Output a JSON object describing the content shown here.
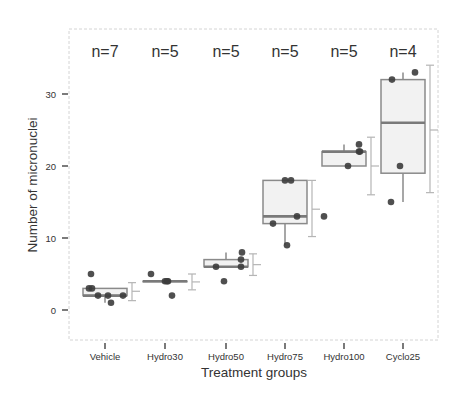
{
  "chart_data": {
    "type": "box",
    "title": "",
    "xlabel": "Treatment groups",
    "ylabel": "Number of micronuclei",
    "ylim": [
      -4,
      38
    ],
    "yticks": [
      0,
      10,
      20,
      30
    ],
    "grid": false,
    "legend": null,
    "categories": [
      "Vehicle",
      "Hydro30",
      "Hydro50",
      "Hydro75",
      "Hydro100",
      "Cyclo25"
    ],
    "n_labels": [
      "n=7",
      "n=5",
      "n=5",
      "n=5",
      "n=5",
      "n=4"
    ],
    "boxes": [
      {
        "category": "Vehicle",
        "min": 1,
        "q1": 2,
        "median": 2,
        "q3": 3,
        "max": 5,
        "whisker_low": 1,
        "whisker_high": 3
      },
      {
        "category": "Hydro30",
        "min": 2,
        "q1": 4,
        "median": 4,
        "q3": 4,
        "max": 5,
        "whisker_low": 4,
        "whisker_high": 4
      },
      {
        "category": "Hydro50",
        "min": 4,
        "q1": 6,
        "median": 6,
        "q3": 7,
        "max": 8,
        "whisker_low": 6,
        "whisker_high": 8
      },
      {
        "category": "Hydro75",
        "min": 9,
        "q1": 12,
        "median": 13,
        "q3": 18,
        "max": 18,
        "whisker_low": 9,
        "whisker_high": 18
      },
      {
        "category": "Hydro100",
        "min": 13,
        "q1": 20,
        "median": 22,
        "q3": 22,
        "max": 23,
        "whisker_low": 20,
        "whisker_high": 23
      },
      {
        "category": "Cyclo25",
        "min": 15,
        "q1": 19,
        "median": 26,
        "q3": 32,
        "max": 33,
        "whisker_low": 15,
        "whisker_high": 33
      }
    ],
    "points": [
      {
        "category": "Vehicle",
        "values": [
          5,
          3,
          3,
          2,
          2,
          1,
          2
        ],
        "x_offsets": [
          -14,
          -16,
          -13,
          -7,
          3,
          6,
          18
        ]
      },
      {
        "category": "Hydro30",
        "values": [
          5,
          4,
          4,
          2,
          4
        ],
        "x_offsets": [
          -14,
          0,
          3,
          7,
          2
        ]
      },
      {
        "category": "Hydro50",
        "values": [
          8,
          7,
          6,
          6,
          4
        ],
        "x_offsets": [
          16,
          15,
          -10,
          15,
          -2
        ]
      },
      {
        "category": "Hydro75",
        "values": [
          18,
          18,
          13,
          12,
          9
        ],
        "x_offsets": [
          0,
          6,
          12,
          -12,
          2
        ]
      },
      {
        "category": "Hydro100",
        "values": [
          23,
          22,
          22,
          20,
          13
        ],
        "x_offsets": [
          15,
          15,
          16,
          4,
          -20
        ]
      },
      {
        "category": "Cyclo25",
        "values": [
          33,
          32,
          20,
          15
        ],
        "x_offsets": [
          12,
          -11,
          -3,
          -12
        ]
      }
    ],
    "error_bars": [
      {
        "category": "Vehicle",
        "low": 1.3,
        "mean": 2.6,
        "high": 3.8
      },
      {
        "category": "Hydro30",
        "low": 2.8,
        "mean": 3.9,
        "high": 5.0
      },
      {
        "category": "Hydro50",
        "low": 4.8,
        "mean": 6.3,
        "high": 7.8
      },
      {
        "category": "Hydro75",
        "low": 10.2,
        "mean": 14.0,
        "high": 18.0
      },
      {
        "category": "Hydro100",
        "low": 16.0,
        "mean": 20.0,
        "high": 24.0
      },
      {
        "category": "Cyclo25",
        "low": 16.3,
        "mean": 25.0,
        "high": 34.0
      }
    ],
    "colors": {
      "box_fill": "#f2f2f2",
      "box_stroke": "#8a8a8a",
      "median": "#7a7a7a",
      "point": "#3c3c3c",
      "error_bar": "#b5b5b5",
      "panel_border": "#cfcfcf",
      "axis_text": "#333333"
    }
  }
}
